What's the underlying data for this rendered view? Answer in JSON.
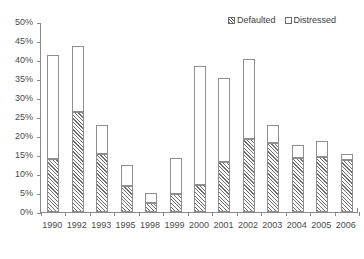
{
  "chart_data": {
    "type": "bar",
    "stacked": true,
    "title": "",
    "subtitle": "",
    "xlabel": "",
    "ylabel": "",
    "ylim": [
      0,
      50
    ],
    "ytick_labels": [
      "0%",
      "5%",
      "10%",
      "15%",
      "20%",
      "25%",
      "30%",
      "35%",
      "40%",
      "45%",
      "50%"
    ],
    "ytick_values": [
      0,
      5,
      10,
      15,
      20,
      25,
      30,
      35,
      40,
      45,
      50
    ],
    "grid": false,
    "legend_position": "top-right",
    "categories": [
      "1990",
      "1992",
      "1993",
      "1995",
      "1998",
      "1999",
      "2000",
      "2001",
      "2002",
      "2003",
      "2004",
      "2005",
      "2006"
    ],
    "series": [
      {
        "name": "Defaulted",
        "fill": "diagonal-hatch",
        "values": [
          13.9,
          26.3,
          15.3,
          6.9,
          2.5,
          4.8,
          7.0,
          13.2,
          19.3,
          18.2,
          14.2,
          14.4,
          13.7
        ]
      },
      {
        "name": "Distressed",
        "fill": "white",
        "values": [
          27.5,
          17.3,
          7.5,
          5.6,
          2.5,
          9.4,
          31.3,
          22.0,
          20.9,
          4.6,
          3.4,
          4.3,
          1.5
        ]
      }
    ],
    "totals": [
      41.4,
      43.6,
      22.8,
      12.5,
      5.0,
      14.2,
      38.3,
      35.2,
      40.2,
      22.8,
      17.6,
      18.7,
      15.2
    ]
  },
  "legend": {
    "items": [
      {
        "label": "Defaulted",
        "swatch": "hatched-swatch"
      },
      {
        "label": "Distressed",
        "swatch": "empty-swatch"
      }
    ]
  },
  "colors": {
    "axis": "#8a8a8a",
    "text": "#4a4a4a",
    "bar_outline": "#8e8e8e",
    "hatch": "#6e6e6e",
    "background": "#ffffff"
  }
}
